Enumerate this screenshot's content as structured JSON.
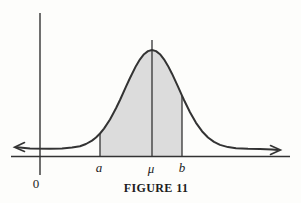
{
  "figure": {
    "caption": "FIGURE 11",
    "labels": {
      "origin": "0",
      "a": "a",
      "mu": "μ",
      "b": "b"
    },
    "colors": {
      "line": "#333333",
      "shade": "#dcdcdc",
      "background": "#fdfdfb",
      "text": "#1c1c1c"
    }
  }
}
